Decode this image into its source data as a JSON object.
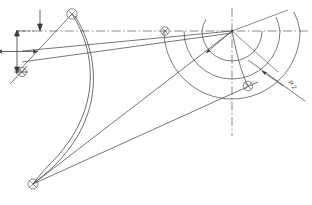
{
  "drawing": {
    "title": "Geometric construction drawing",
    "background_color": "#ffffff",
    "line_color": "#4a4a4a",
    "thin_line_color": "#6b6b6b",
    "center_line_color": "#555555",
    "canvas": {
      "width": 312,
      "height": 205
    },
    "labels": {
      "radius_label": "R 2",
      "radius_label_rotation": 55,
      "radius_label_x": 291,
      "radius_label_y": 86
    },
    "center_point": {
      "x": 232,
      "y": 31,
      "name": "arc-center"
    },
    "points": [
      {
        "name": "point-top-apex",
        "x": 72,
        "y": 14,
        "marker": "circle-cross"
      },
      {
        "name": "point-left-mid",
        "x": 22,
        "y": 72,
        "marker": "circle-cross"
      },
      {
        "name": "point-bottom-left",
        "x": 33,
        "y": 184,
        "marker": "circle-cross"
      },
      {
        "name": "point-center-left",
        "x": 165,
        "y": 31,
        "marker": "circle-cross"
      },
      {
        "name": "point-lower-right",
        "x": 248,
        "y": 86,
        "marker": "circle-cross"
      }
    ],
    "arcs": [
      {
        "name": "arc-inner",
        "radius": 30
      },
      {
        "name": "arc-middle",
        "radius": 48
      },
      {
        "name": "arc-outer",
        "radius": 68
      }
    ],
    "dimension": {
      "name": "vertical-dimension",
      "x": 17,
      "top_y": 30,
      "bottom_y": 72
    }
  }
}
